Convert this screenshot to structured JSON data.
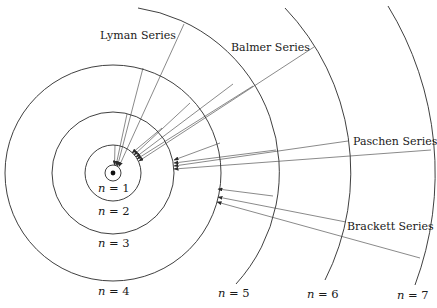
{
  "diagram": {
    "series_labels": {
      "lyman": "Lyman Series",
      "balmer": "Balmer Series",
      "paschen": "Paschen Series",
      "brackett": "Brackett Series"
    },
    "levels": [
      {
        "n_var": "n",
        "eq": " = 1"
      },
      {
        "n_var": "n",
        "eq": " = 2"
      },
      {
        "n_var": "n",
        "eq": " = 3"
      },
      {
        "n_var": "n",
        "eq": " = 4"
      },
      {
        "n_var": "n",
        "eq": " = 5"
      },
      {
        "n_var": "n",
        "eq": " = 6"
      },
      {
        "n_var": "n",
        "eq": " = 7"
      }
    ],
    "colors": {
      "line": "#2a2a2a",
      "text": "#1a1a1a",
      "background": "#ffffff"
    }
  }
}
